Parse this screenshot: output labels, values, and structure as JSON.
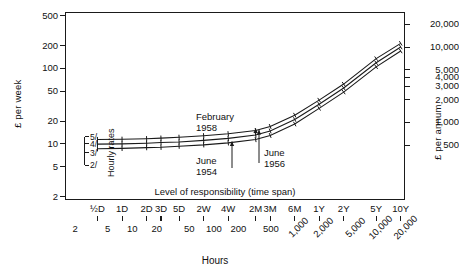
{
  "chart_data": {
    "type": "line",
    "title": "",
    "xlabel": "Hours",
    "xlabel_secondary": "Level of responsibility (time span)",
    "ylabel": "£ per week",
    "ylabel_right": "£ per annum",
    "xscale": "log",
    "yscale": "log",
    "xlim": [
      1.5,
      22000
    ],
    "ylim": [
      1.8,
      560
    ],
    "grid": false,
    "legend": "none",
    "x_tick_hours": [
      "2",
      "5",
      "10",
      "20",
      "50",
      "100",
      "200",
      "500",
      "1,000",
      "2,000",
      "5,000",
      "10,000",
      "20,000"
    ],
    "x_tick_hours_values": [
      2,
      5,
      10,
      20,
      50,
      100,
      200,
      500,
      1000,
      2000,
      5000,
      10000,
      20000
    ],
    "x_tick_timespan": [
      "½D",
      "1D",
      "2D",
      "3D",
      "5D",
      "2W",
      "4W",
      "2M",
      "3M",
      "6M",
      "1Y",
      "2Y",
      "5Y",
      "10Y"
    ],
    "x_tick_timespan_values": [
      3.75,
      7.5,
      15,
      22.5,
      37.5,
      75,
      150,
      325,
      490,
      980,
      1950,
      3900,
      9750,
      19500
    ],
    "y_tick_left": [
      "500",
      "200",
      "100",
      "50",
      "20",
      "10",
      "5",
      "2"
    ],
    "y_tick_left_values": [
      500,
      200,
      100,
      50,
      20,
      10,
      5,
      2
    ],
    "y_tick_right": [
      "20,000",
      "10,000",
      "5,000",
      "4,000",
      "3,000",
      "2,000",
      "1,000",
      "500"
    ],
    "y_tick_right_values": [
      20000,
      10000,
      5000,
      4000,
      3000,
      2000,
      1000,
      500
    ],
    "inplot_scale_label": "Hourly rates",
    "inplot_scale_ticks": [
      "5/",
      "4/",
      "3/",
      "2/"
    ],
    "inplot_scale_values": [
      12.5,
      10.0,
      7.6,
      5.2
    ],
    "series": [
      {
        "name": "February 1958",
        "x": [
          3.75,
          7.5,
          15,
          22.5,
          37.5,
          75,
          150,
          325,
          490,
          980,
          1950,
          3900,
          9750,
          19500
        ],
        "values": [
          11.4,
          11.5,
          11.7,
          11.9,
          12.2,
          12.8,
          13.6,
          15.0,
          17.0,
          24.0,
          38.0,
          62.0,
          135.0,
          215.0
        ]
      },
      {
        "name": "June 1956",
        "x": [
          3.75,
          7.5,
          15,
          22.5,
          37.5,
          75,
          150,
          325,
          490,
          980,
          1950,
          3900,
          9750,
          19500
        ],
        "values": [
          9.9,
          10.0,
          10.2,
          10.4,
          10.6,
          11.1,
          11.8,
          13.1,
          14.8,
          21.0,
          33.5,
          55.0,
          119.0,
          192.0
        ]
      },
      {
        "name": "June 1954",
        "x": [
          3.75,
          7.5,
          15,
          22.5,
          37.5,
          75,
          150,
          325,
          490,
          980,
          1950,
          3900,
          9750,
          19500
        ],
        "values": [
          8.6,
          8.7,
          8.9,
          9.0,
          9.3,
          9.7,
          10.3,
          11.4,
          12.9,
          18.3,
          29.5,
          48.5,
          105.0,
          170.0
        ]
      }
    ],
    "annotations": [
      {
        "id": "february-1958",
        "line1": "February",
        "line2": "1958",
        "arrow": "down"
      },
      {
        "id": "june-1954",
        "line1": "June",
        "line2": "1954",
        "arrow": "up"
      },
      {
        "id": "june-1956",
        "line1": "June",
        "line2": "1956",
        "arrow": "up"
      }
    ],
    "line_color": "#1a1a1a"
  },
  "colors": {
    "ink": "#1a1a1a",
    "background": "#ffffff"
  }
}
